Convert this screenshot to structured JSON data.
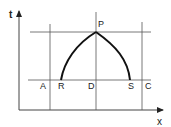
{
  "diagram": {
    "axes": {
      "y_label": "t",
      "x_label": "x"
    },
    "points": {
      "P": "P",
      "A": "A",
      "R": "R",
      "D": "D",
      "S": "S",
      "C": "C"
    },
    "colors": {
      "stroke": "#222222",
      "background": "#ffffff"
    }
  }
}
